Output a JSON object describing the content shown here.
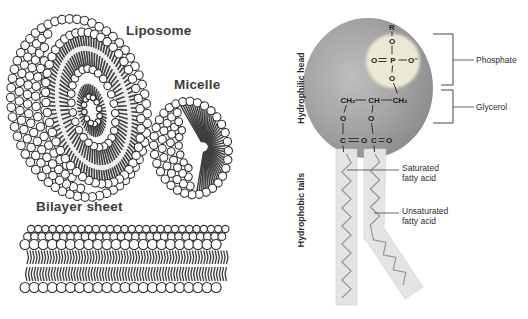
{
  "left_panel": {
    "labels": {
      "liposome": "Liposome",
      "micelle": "Micelle",
      "bilayer_sheet": "Bilayer sheet"
    }
  },
  "right_panel": {
    "side_labels": {
      "hydrophilic_head": "Hydrophilic head",
      "hydrophobic_tails": "Hydrophobic tails"
    },
    "callouts": {
      "phosphate": "Phosphate",
      "glycerol": "Glycerol",
      "saturated": "Saturated\nfatty acid",
      "unsaturated": "Unsaturated\nfatty acid"
    },
    "formula": {
      "atoms": [
        "R",
        "O",
        "O",
        "P",
        "O⁻",
        "O",
        "CH₂",
        "CH",
        "CH₂",
        "O",
        "O",
        "C",
        "O",
        "C",
        "O"
      ]
    },
    "colors": {
      "head_sphere_light": "#bcbcbc",
      "head_sphere_mid": "#a4a4a4",
      "head_sphere_edge": "#868686",
      "highlight_circle": "#ece8d6",
      "tail_band": "#e4e4e4",
      "zigzag": "#9b9b9b",
      "line_art": "#2e2e2e"
    }
  }
}
